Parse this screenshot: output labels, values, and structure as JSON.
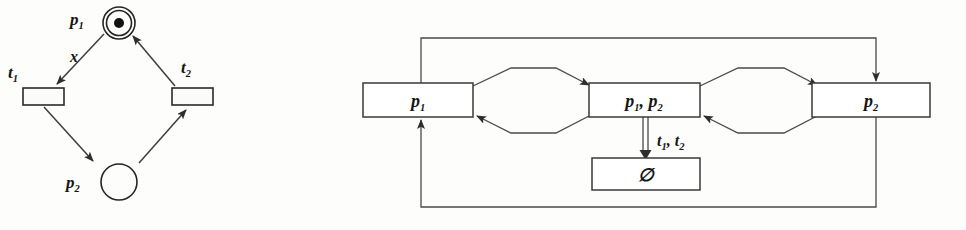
{
  "figure": {
    "caption": "",
    "background_color": "#fdfdfb",
    "ink_color": "#2a2a2a"
  },
  "petri_net": {
    "name": "petri-net-diagram",
    "places": [
      {
        "id": "p1",
        "label": "p",
        "subscript": "1",
        "marked": true,
        "tokens": 1,
        "style": "double-circle"
      },
      {
        "id": "p2",
        "label": "p",
        "subscript": "2",
        "marked": false,
        "tokens": 0,
        "style": "circle"
      }
    ],
    "transitions": [
      {
        "id": "t1",
        "label": "t",
        "subscript": "1"
      },
      {
        "id": "t2",
        "label": "t",
        "subscript": "2"
      }
    ],
    "arc_labels": [
      {
        "id": "x",
        "text": "x"
      }
    ],
    "arcs": [
      {
        "from": "p1",
        "to": "t1",
        "label": "x"
      },
      {
        "from": "t1",
        "to": "p2",
        "label": ""
      },
      {
        "from": "p2",
        "to": "t2",
        "label": ""
      },
      {
        "from": "t2",
        "to": "p1",
        "label": ""
      }
    ]
  },
  "reachability_graph": {
    "name": "reachability-graph-diagram",
    "nodes": [
      {
        "id": "n1",
        "text": "p",
        "subscript": "1",
        "full": "p1"
      },
      {
        "id": "n2",
        "text": "p",
        "subscript": "1",
        "text2": ", p",
        "subscript2": "2",
        "full": "p1, p2"
      },
      {
        "id": "n3",
        "text": "p",
        "subscript": "2",
        "full": "p2"
      },
      {
        "id": "n4",
        "text": "∅",
        "full": "empty-set"
      }
    ],
    "edges": [
      {
        "from": "n1",
        "to": "n2",
        "label": ""
      },
      {
        "from": "n2",
        "to": "n1",
        "label": ""
      },
      {
        "from": "n2",
        "to": "n3",
        "label": ""
      },
      {
        "from": "n3",
        "to": "n2",
        "label": ""
      },
      {
        "from": "n2",
        "to": "n4",
        "label": "t1, t2",
        "style": "double-line"
      },
      {
        "from": "n3",
        "to": "n1",
        "label": "",
        "style": "outer-loop-bottom"
      },
      {
        "from": "n1",
        "to": "n3",
        "label": "",
        "style": "outer-loop-top"
      }
    ],
    "edge_labels": [
      {
        "id": "t1t2",
        "text": "t",
        "subscript": "1",
        "text2": ", t",
        "subscript2": "2"
      }
    ]
  }
}
